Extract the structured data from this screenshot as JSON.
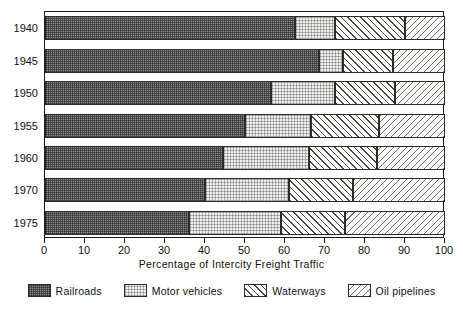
{
  "chart_data": {
    "type": "bar",
    "orientation": "horizontal",
    "stacked": true,
    "title": "",
    "xlabel": "Percentage of Intercity Freight Traffic",
    "ylabel": "",
    "xlim": [
      0,
      100
    ],
    "xticks": [
      0,
      10,
      20,
      30,
      40,
      50,
      60,
      70,
      80,
      90,
      100
    ],
    "xtick_labels": [
      "0",
      "10",
      "20",
      "30",
      "40",
      "50",
      "60",
      "70",
      "80",
      "90",
      "100"
    ],
    "grid": false,
    "legend_position": "bottom",
    "categories": [
      "1940",
      "1945",
      "1950",
      "1955",
      "1960",
      "1970",
      "1975"
    ],
    "series": [
      {
        "name": "Railroads",
        "values": [
          62.5,
          68.5,
          56.5,
          50.0,
          44.5,
          40.0,
          36.0
        ]
      },
      {
        "name": "Motor vehicles",
        "values": [
          10.0,
          6.0,
          16.0,
          16.5,
          21.5,
          21.0,
          23.0
        ]
      },
      {
        "name": "Waterways",
        "values": [
          17.5,
          12.5,
          15.0,
          17.0,
          17.0,
          16.0,
          16.0
        ]
      },
      {
        "name": "Oil pipelines",
        "values": [
          10.0,
          13.0,
          12.5,
          16.5,
          17.0,
          23.0,
          25.0
        ]
      }
    ],
    "cumulative_boundaries": [
      [
        62.5,
        72.5,
        90.0,
        100
      ],
      [
        68.5,
        74.5,
        87.0,
        100
      ],
      [
        56.5,
        72.5,
        87.5,
        100
      ],
      [
        50.0,
        66.5,
        83.5,
        100
      ],
      [
        44.5,
        66.0,
        83.0,
        100
      ],
      [
        40.0,
        61.0,
        77.0,
        100
      ],
      [
        36.0,
        59.0,
        75.0,
        100
      ]
    ],
    "patterns": [
      "railroads",
      "motor",
      "waterways",
      "oil"
    ],
    "colors": {
      "railroads": "#8e8e8e",
      "motor_vehicles": "#f0f0ee",
      "waterways": "#fbfbfa",
      "oil_pipelines": "#fbfbfa",
      "axis": "#1a1a1a",
      "text": "#111111",
      "background": "#ffffff"
    }
  },
  "legend": {
    "items": [
      {
        "label": "Railroads",
        "pattern": "railroads"
      },
      {
        "label": "Motor vehicles",
        "pattern": "motor"
      },
      {
        "label": "Waterways",
        "pattern": "waterways"
      },
      {
        "label": "Oil pipelines",
        "pattern": "oil"
      }
    ]
  }
}
